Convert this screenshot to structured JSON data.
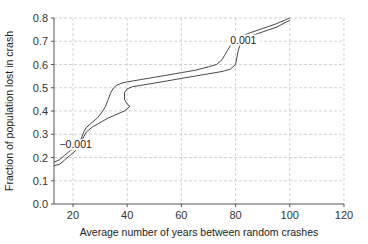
{
  "chart_data": {
    "type": "line",
    "title": "",
    "xlabel": "Average number of years between random crashes",
    "ylabel": "Fraction of population lost in crash",
    "xlim": [
      13,
      120
    ],
    "ylim": [
      0.0,
      0.8
    ],
    "xticks": [
      20,
      40,
      60,
      80,
      100,
      120
    ],
    "yticks": [
      0.0,
      0.1,
      0.2,
      0.3,
      0.4,
      0.5,
      0.6,
      0.7,
      0.8
    ],
    "xtick_labels": [
      "20",
      "40",
      "60",
      "80",
      "100",
      "120"
    ],
    "ytick_labels": [
      "0.0",
      "0.1",
      "0.2",
      "0.3",
      "0.4",
      "0.5",
      "0.6",
      "0.7",
      "0.8"
    ],
    "grid": true,
    "legend": null,
    "annotations": [
      {
        "text": "−0.001",
        "x": 15,
        "y": 0.24
      },
      {
        "text": "0.001",
        "x": 78,
        "y": 0.69
      }
    ],
    "series": [
      {
        "name": "contour upper",
        "x": [
          13,
          15,
          17,
          19,
          21,
          22,
          23,
          24,
          25,
          27,
          29,
          31,
          32,
          33,
          34,
          35,
          36,
          38,
          40,
          45,
          50,
          55,
          60,
          65,
          70,
          73,
          75,
          76,
          77,
          78,
          79,
          80,
          82,
          85,
          90,
          95,
          100
        ],
        "y": [
          0.18,
          0.19,
          0.21,
          0.23,
          0.24,
          0.26,
          0.28,
          0.31,
          0.33,
          0.35,
          0.37,
          0.4,
          0.42,
          0.45,
          0.48,
          0.5,
          0.51,
          0.52,
          0.525,
          0.535,
          0.545,
          0.555,
          0.565,
          0.575,
          0.59,
          0.6,
          0.62,
          0.64,
          0.66,
          0.68,
          0.7,
          0.71,
          0.72,
          0.735,
          0.755,
          0.775,
          0.8
        ]
      },
      {
        "name": "contour lower",
        "x": [
          13,
          15,
          17,
          19,
          21,
          22,
          23,
          24,
          25,
          27,
          30,
          33,
          35,
          37,
          39,
          41,
          40,
          39,
          39,
          40,
          42,
          45,
          50,
          55,
          60,
          65,
          70,
          75,
          78,
          80,
          80.5,
          81,
          82,
          85,
          90,
          95,
          100
        ],
        "y": [
          0.165,
          0.17,
          0.19,
          0.21,
          0.23,
          0.245,
          0.265,
          0.29,
          0.31,
          0.33,
          0.35,
          0.37,
          0.38,
          0.39,
          0.4,
          0.42,
          0.43,
          0.45,
          0.48,
          0.495,
          0.505,
          0.51,
          0.52,
          0.53,
          0.54,
          0.55,
          0.56,
          0.57,
          0.58,
          0.6,
          0.63,
          0.66,
          0.7,
          0.72,
          0.74,
          0.76,
          0.79
        ]
      }
    ]
  }
}
